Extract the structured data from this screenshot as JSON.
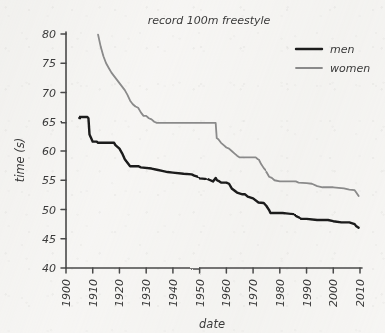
{
  "chart_data": {
    "type": "line",
    "title": "record 100m freestyle",
    "xlabel": "date",
    "ylabel": "time (s)",
    "xlim": [
      1900,
      2010
    ],
    "ylim": [
      40,
      80
    ],
    "xticks": [
      1900,
      1910,
      1920,
      1930,
      1940,
      1950,
      1960,
      1970,
      1980,
      1990,
      2000,
      2010
    ],
    "yticks": [
      40,
      45,
      50,
      55,
      60,
      65,
      70,
      75,
      80
    ],
    "xtick_labels": [
      "1900",
      "1910",
      "1920",
      "1930",
      "1940",
      "1950",
      "1960",
      "1970",
      "1980",
      "1990",
      "2000",
      "2010"
    ],
    "ytick_labels": [
      "40",
      "45",
      "50",
      "55",
      "60",
      "65",
      "70",
      "75",
      "80"
    ],
    "grid": false,
    "legend_position": "top-right",
    "style": "hand-drawn",
    "series": [
      {
        "name": "men",
        "color": "#1a1a1a",
        "linewidth": 2.4,
        "points": [
          [
            1905.0,
            65.8
          ],
          [
            1908.0,
            65.8
          ],
          [
            1908.4,
            65.6
          ],
          [
            1908.8,
            62.8
          ],
          [
            1910.0,
            61.6
          ],
          [
            1911.5,
            61.6
          ],
          [
            1912.0,
            61.4
          ],
          [
            1913.0,
            61.4
          ],
          [
            1918.0,
            61.4
          ],
          [
            1918.5,
            61.0
          ],
          [
            1920.0,
            60.4
          ],
          [
            1921.0,
            59.6
          ],
          [
            1922.0,
            58.6
          ],
          [
            1923.0,
            58.0
          ],
          [
            1924.0,
            57.4
          ],
          [
            1927.0,
            57.4
          ],
          [
            1928.0,
            57.2
          ],
          [
            1932.0,
            57.0
          ],
          [
            1934.0,
            56.8
          ],
          [
            1936.0,
            56.6
          ],
          [
            1938.0,
            56.4
          ],
          [
            1940.0,
            56.3
          ],
          [
            1944.0,
            56.1
          ],
          [
            1947.0,
            56.0
          ],
          [
            1948.0,
            55.8
          ],
          [
            1950.0,
            55.5
          ],
          [
            1952.0,
            55.4
          ],
          [
            1954.0,
            55.0
          ],
          [
            1955.0,
            54.8
          ],
          [
            1956.0,
            55.4
          ],
          [
            1956.5,
            55.0
          ],
          [
            1957.0,
            54.9
          ],
          [
            1958.0,
            54.6
          ],
          [
            1959.0,
            54.6
          ],
          [
            1960.0,
            54.6
          ],
          [
            1961.0,
            54.4
          ],
          [
            1962.0,
            53.6
          ],
          [
            1964.0,
            52.9
          ],
          [
            1966.0,
            52.6
          ],
          [
            1967.0,
            52.6
          ],
          [
            1968.0,
            52.2
          ],
          [
            1970.0,
            51.9
          ],
          [
            1972.0,
            51.2
          ],
          [
            1974.0,
            51.1
          ],
          [
            1975.0,
            50.6
          ],
          [
            1976.0,
            49.9
          ],
          [
            1976.5,
            49.4
          ],
          [
            1978.0,
            49.4
          ],
          [
            1981.0,
            49.4
          ],
          [
            1983.0,
            49.3
          ],
          [
            1985.0,
            49.2
          ],
          [
            1986.0,
            48.8
          ],
          [
            1988.0,
            48.4
          ],
          [
            1990.0,
            48.4
          ],
          [
            1994.0,
            48.2
          ],
          [
            1998.0,
            48.2
          ],
          [
            2000.0,
            48.0
          ],
          [
            2003.0,
            47.8
          ],
          [
            2006.0,
            47.8
          ],
          [
            2008.0,
            47.5
          ],
          [
            2008.5,
            47.2
          ],
          [
            2009.5,
            46.9
          ]
        ]
      },
      {
        "name": "women",
        "color": "#8a8a8a",
        "linewidth": 1.8,
        "points": [
          [
            1912.0,
            79.9
          ],
          [
            1913.0,
            77.8
          ],
          [
            1914.0,
            76.2
          ],
          [
            1915.0,
            75.0
          ],
          [
            1916.0,
            74.2
          ],
          [
            1917.0,
            73.4
          ],
          [
            1918.0,
            72.8
          ],
          [
            1919.0,
            72.2
          ],
          [
            1920.0,
            71.6
          ],
          [
            1921.0,
            71.0
          ],
          [
            1922.0,
            70.4
          ],
          [
            1923.0,
            69.6
          ],
          [
            1924.0,
            68.6
          ],
          [
            1925.0,
            68.0
          ],
          [
            1926.0,
            67.6
          ],
          [
            1927.0,
            67.4
          ],
          [
            1928.0,
            66.6
          ],
          [
            1929.0,
            66.0
          ],
          [
            1930.0,
            66.0
          ],
          [
            1931.0,
            65.6
          ],
          [
            1932.0,
            65.4
          ],
          [
            1933.0,
            65.0
          ],
          [
            1934.0,
            64.8
          ],
          [
            1935.0,
            64.8
          ],
          [
            1940.0,
            64.8
          ],
          [
            1945.0,
            64.8
          ],
          [
            1950.0,
            64.8
          ],
          [
            1955.0,
            64.8
          ],
          [
            1956.0,
            64.8
          ],
          [
            1956.4,
            62.2
          ],
          [
            1957.0,
            62.0
          ],
          [
            1958.0,
            61.4
          ],
          [
            1959.0,
            61.0
          ],
          [
            1960.0,
            60.6
          ],
          [
            1961.0,
            60.4
          ],
          [
            1962.0,
            60.0
          ],
          [
            1963.0,
            59.6
          ],
          [
            1964.0,
            59.2
          ],
          [
            1965.0,
            58.9
          ],
          [
            1966.0,
            58.9
          ],
          [
            1970.0,
            58.9
          ],
          [
            1971.0,
            58.9
          ],
          [
            1972.0,
            58.5
          ],
          [
            1973.0,
            57.6
          ],
          [
            1974.0,
            56.9
          ],
          [
            1975.0,
            56.4
          ],
          [
            1976.0,
            55.6
          ],
          [
            1977.0,
            55.4
          ],
          [
            1978.0,
            55.0
          ],
          [
            1980.0,
            54.8
          ],
          [
            1984.0,
            54.8
          ],
          [
            1986.0,
            54.8
          ],
          [
            1987.0,
            54.6
          ],
          [
            1990.0,
            54.5
          ],
          [
            1992.0,
            54.4
          ],
          [
            1994.0,
            54.0
          ],
          [
            1996.0,
            53.8
          ],
          [
            2000.0,
            53.8
          ],
          [
            2004.0,
            53.6
          ],
          [
            2006.0,
            53.4
          ],
          [
            2008.0,
            53.3
          ],
          [
            2008.6,
            52.9
          ],
          [
            2009.5,
            52.3
          ]
        ]
      }
    ]
  },
  "legend": {
    "items": [
      {
        "label": "men",
        "color": "#1a1a1a"
      },
      {
        "label": "women",
        "color": "#8a8a8a"
      }
    ]
  }
}
